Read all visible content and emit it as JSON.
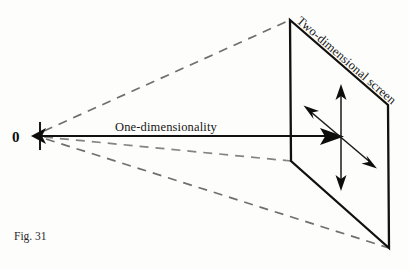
{
  "figure": {
    "caption": "Fig. 31",
    "origin_label": "0",
    "axis_label": "One-dimensionality",
    "screen_label": "Two-dimensional screen",
    "colors": {
      "ink": "#0d0d0d",
      "dashed": "#6f6f6f",
      "background": "#fdfdfb"
    },
    "icons": {
      "origin_marker": "left-arrowhead-icon",
      "axis_terminus": "right-arrowhead-icon",
      "vertical_axis": "double-headed-vertical-arrow-icon",
      "diagonal_axis": "double-headed-diagonal-arrow-icon"
    }
  }
}
